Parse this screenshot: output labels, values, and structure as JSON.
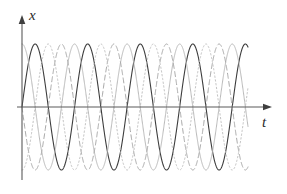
{
  "figure": {
    "title": "",
    "background_color": "#ffffff",
    "width": 287,
    "height": 194
  },
  "axes": {
    "y_axis": {
      "label": "x",
      "name": "vertical-axis",
      "color": "#5a5a5a",
      "arrow": "up-arrow"
    },
    "x_axis": {
      "label": "t",
      "name": "horizontal-axis",
      "color": "#5a5a5a",
      "arrow": "right-arrow"
    }
  },
  "chart_data": {
    "type": "line",
    "title": "",
    "xlabel": "t",
    "ylabel": "x",
    "grid": false,
    "legend": "none",
    "xlim": [
      0,
      8.6
    ],
    "ylim": [
      -1.15,
      1.15
    ],
    "x_tick_labels": [],
    "y_tick_labels": [],
    "common": {
      "amplitude": 1,
      "period": 2,
      "cycles_drawn": 8.6
    },
    "series": [
      {
        "name": "wave-solid-dark",
        "style": "solid",
        "color": "#3d3d3d",
        "width": 1.1,
        "amplitude": 1,
        "period": 2,
        "phase": 0.0,
        "phase_label": "0"
      },
      {
        "name": "wave-solid-light",
        "style": "solid",
        "color": "#b9b9b9",
        "width": 1.0,
        "amplitude": 1,
        "period": 2,
        "phase": 0.5,
        "phase_label": "T/4"
      },
      {
        "name": "wave-dashed",
        "style": "dashed",
        "color": "#a8a8a8",
        "width": 1.0,
        "amplitude": 1,
        "period": 2,
        "phase": 1.0,
        "phase_label": "T/2"
      },
      {
        "name": "wave-dotted",
        "style": "dotted",
        "color": "#c2c2c2",
        "width": 1.0,
        "amplitude": 1,
        "period": 2,
        "phase": 1.5,
        "phase_label": "3T/4"
      }
    ]
  }
}
